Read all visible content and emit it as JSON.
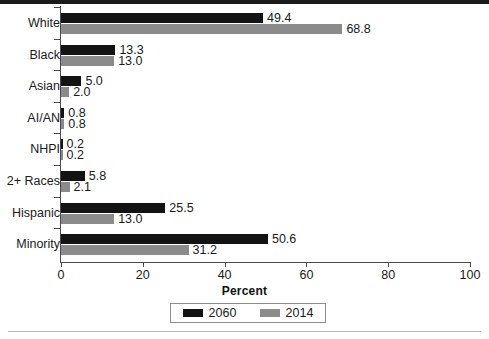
{
  "chart_data": {
    "type": "bar",
    "orientation": "horizontal",
    "title": "",
    "xlabel": "Percent",
    "ylabel": "",
    "xlim": [
      0,
      100
    ],
    "xticks": [
      0,
      20,
      40,
      60,
      80,
      100
    ],
    "grid": false,
    "legend_position": "bottom-center",
    "categories": [
      "White",
      "Black",
      "Asian",
      "AI/AN",
      "NHPI",
      "2+ Races",
      "Hispanic",
      "Minority"
    ],
    "series": [
      {
        "name": "2060",
        "color": "#131313",
        "values": [
          49.4,
          13.3,
          5.0,
          0.8,
          0.2,
          5.8,
          25.5,
          50.6
        ],
        "labels": [
          "49.4",
          "13.3",
          "5.0",
          "0.8",
          "0.2",
          "5.8",
          "25.5",
          "50.6"
        ]
      },
      {
        "name": "2014",
        "color": "#8b8b8b",
        "values": [
          68.8,
          13.0,
          2.0,
          0.8,
          0.2,
          2.1,
          13.0,
          31.2
        ],
        "labels": [
          "68.8",
          "13.0",
          "2.0",
          "0.8",
          "0.2",
          "2.1",
          "13.0",
          "31.2"
        ]
      }
    ]
  },
  "axis": {
    "tick_labels": [
      "0",
      "20",
      "40",
      "60",
      "80",
      "100"
    ],
    "title": "Percent"
  },
  "legend": {
    "items": [
      {
        "label": "2060",
        "color": "#131313"
      },
      {
        "label": "2014",
        "color": "#8b8b8b"
      }
    ]
  }
}
